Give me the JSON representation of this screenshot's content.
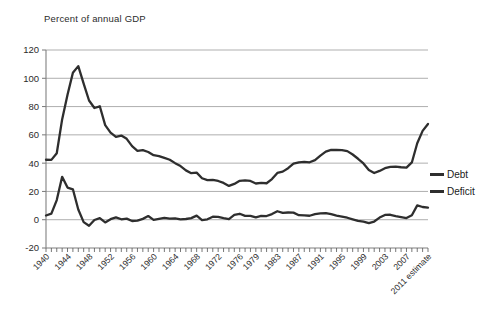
{
  "chart_data": {
    "type": "line",
    "title": "Percent of annual GDP",
    "xlabel": "",
    "ylabel": "",
    "ylim": [
      -20,
      120
    ],
    "ytick_step": 20,
    "yticks": [
      "120",
      "100",
      "80",
      "60",
      "40",
      "20",
      "0",
      "-20"
    ],
    "grid": true,
    "legend_position": "right",
    "xtick_labels": [
      "1940",
      "1944",
      "1948",
      "1952",
      "1956",
      "1960",
      "1964",
      "1968",
      "1972",
      "1976",
      "1979",
      "1983",
      "1987",
      "1991",
      "1995",
      "1999",
      "2003",
      "2007",
      "2011 estimate"
    ],
    "x_start": 1940,
    "x_end": 2011,
    "x": [
      1940,
      1941,
      1942,
      1943,
      1944,
      1945,
      1946,
      1947,
      1948,
      1949,
      1950,
      1951,
      1952,
      1953,
      1954,
      1955,
      1956,
      1957,
      1958,
      1959,
      1960,
      1961,
      1962,
      1963,
      1964,
      1965,
      1966,
      1967,
      1968,
      1969,
      1970,
      1971,
      1972,
      1973,
      1974,
      1975,
      1976,
      1977,
      1978,
      1979,
      1980,
      1981,
      1982,
      1983,
      1984,
      1985,
      1986,
      1987,
      1988,
      1989,
      1990,
      1991,
      1992,
      1993,
      1994,
      1995,
      1996,
      1997,
      1998,
      1999,
      2000,
      2001,
      2002,
      2003,
      2004,
      2005,
      2006,
      2007,
      2008,
      2009,
      2010,
      2011
    ],
    "series": [
      {
        "name": "Debt",
        "color": "#2e2e2e",
        "values": [
          42.4,
          42.3,
          47.0,
          70.9,
          88.3,
          103.9,
          108.6,
          96.2,
          84.3,
          79.0,
          80.2,
          66.9,
          61.6,
          58.6,
          59.5,
          57.2,
          52.0,
          48.7,
          49.2,
          47.9,
          45.6,
          45.0,
          43.7,
          42.4,
          40.0,
          37.9,
          34.9,
          32.9,
          33.3,
          29.3,
          28.0,
          28.1,
          27.4,
          26.0,
          23.9,
          25.3,
          27.5,
          27.8,
          27.4,
          25.6,
          26.1,
          25.8,
          28.7,
          33.1,
          34.0,
          36.4,
          39.6,
          40.6,
          40.9,
          40.6,
          42.1,
          45.3,
          48.1,
          49.4,
          49.3,
          49.2,
          48.5,
          46.1,
          43.1,
          39.8,
          35.1,
          33.0,
          34.5,
          36.4,
          37.3,
          37.5,
          37.1,
          36.8,
          40.5,
          54.1,
          62.8,
          67.7
        ]
      },
      {
        "name": "Deficit",
        "color": "#2e2e2e",
        "values": [
          3.0,
          4.3,
          13.9,
          30.3,
          22.7,
          21.5,
          7.2,
          -1.7,
          -4.3,
          -0.2,
          1.1,
          -1.9,
          0.4,
          1.7,
          0.3,
          0.8,
          -0.9,
          -0.7,
          0.6,
          2.6,
          -0.1,
          0.6,
          1.3,
          0.8,
          0.9,
          0.2,
          0.5,
          1.1,
          2.9,
          -0.3,
          0.3,
          2.1,
          2.0,
          1.1,
          0.4,
          3.4,
          4.2,
          2.7,
          2.7,
          1.6,
          2.7,
          2.6,
          4.0,
          6.0,
          4.8,
          5.1,
          5.0,
          3.2,
          3.1,
          2.8,
          3.9,
          4.5,
          4.7,
          3.9,
          2.9,
          2.2,
          1.4,
          0.3,
          -0.8,
          -1.4,
          -2.4,
          -1.3,
          1.5,
          3.4,
          3.5,
          2.6,
          1.9,
          1.2,
          3.2,
          10.1,
          9.0,
          8.5
        ]
      }
    ]
  },
  "legend": {
    "items": [
      {
        "label": "Debt"
      },
      {
        "label": "Deficit"
      }
    ]
  }
}
